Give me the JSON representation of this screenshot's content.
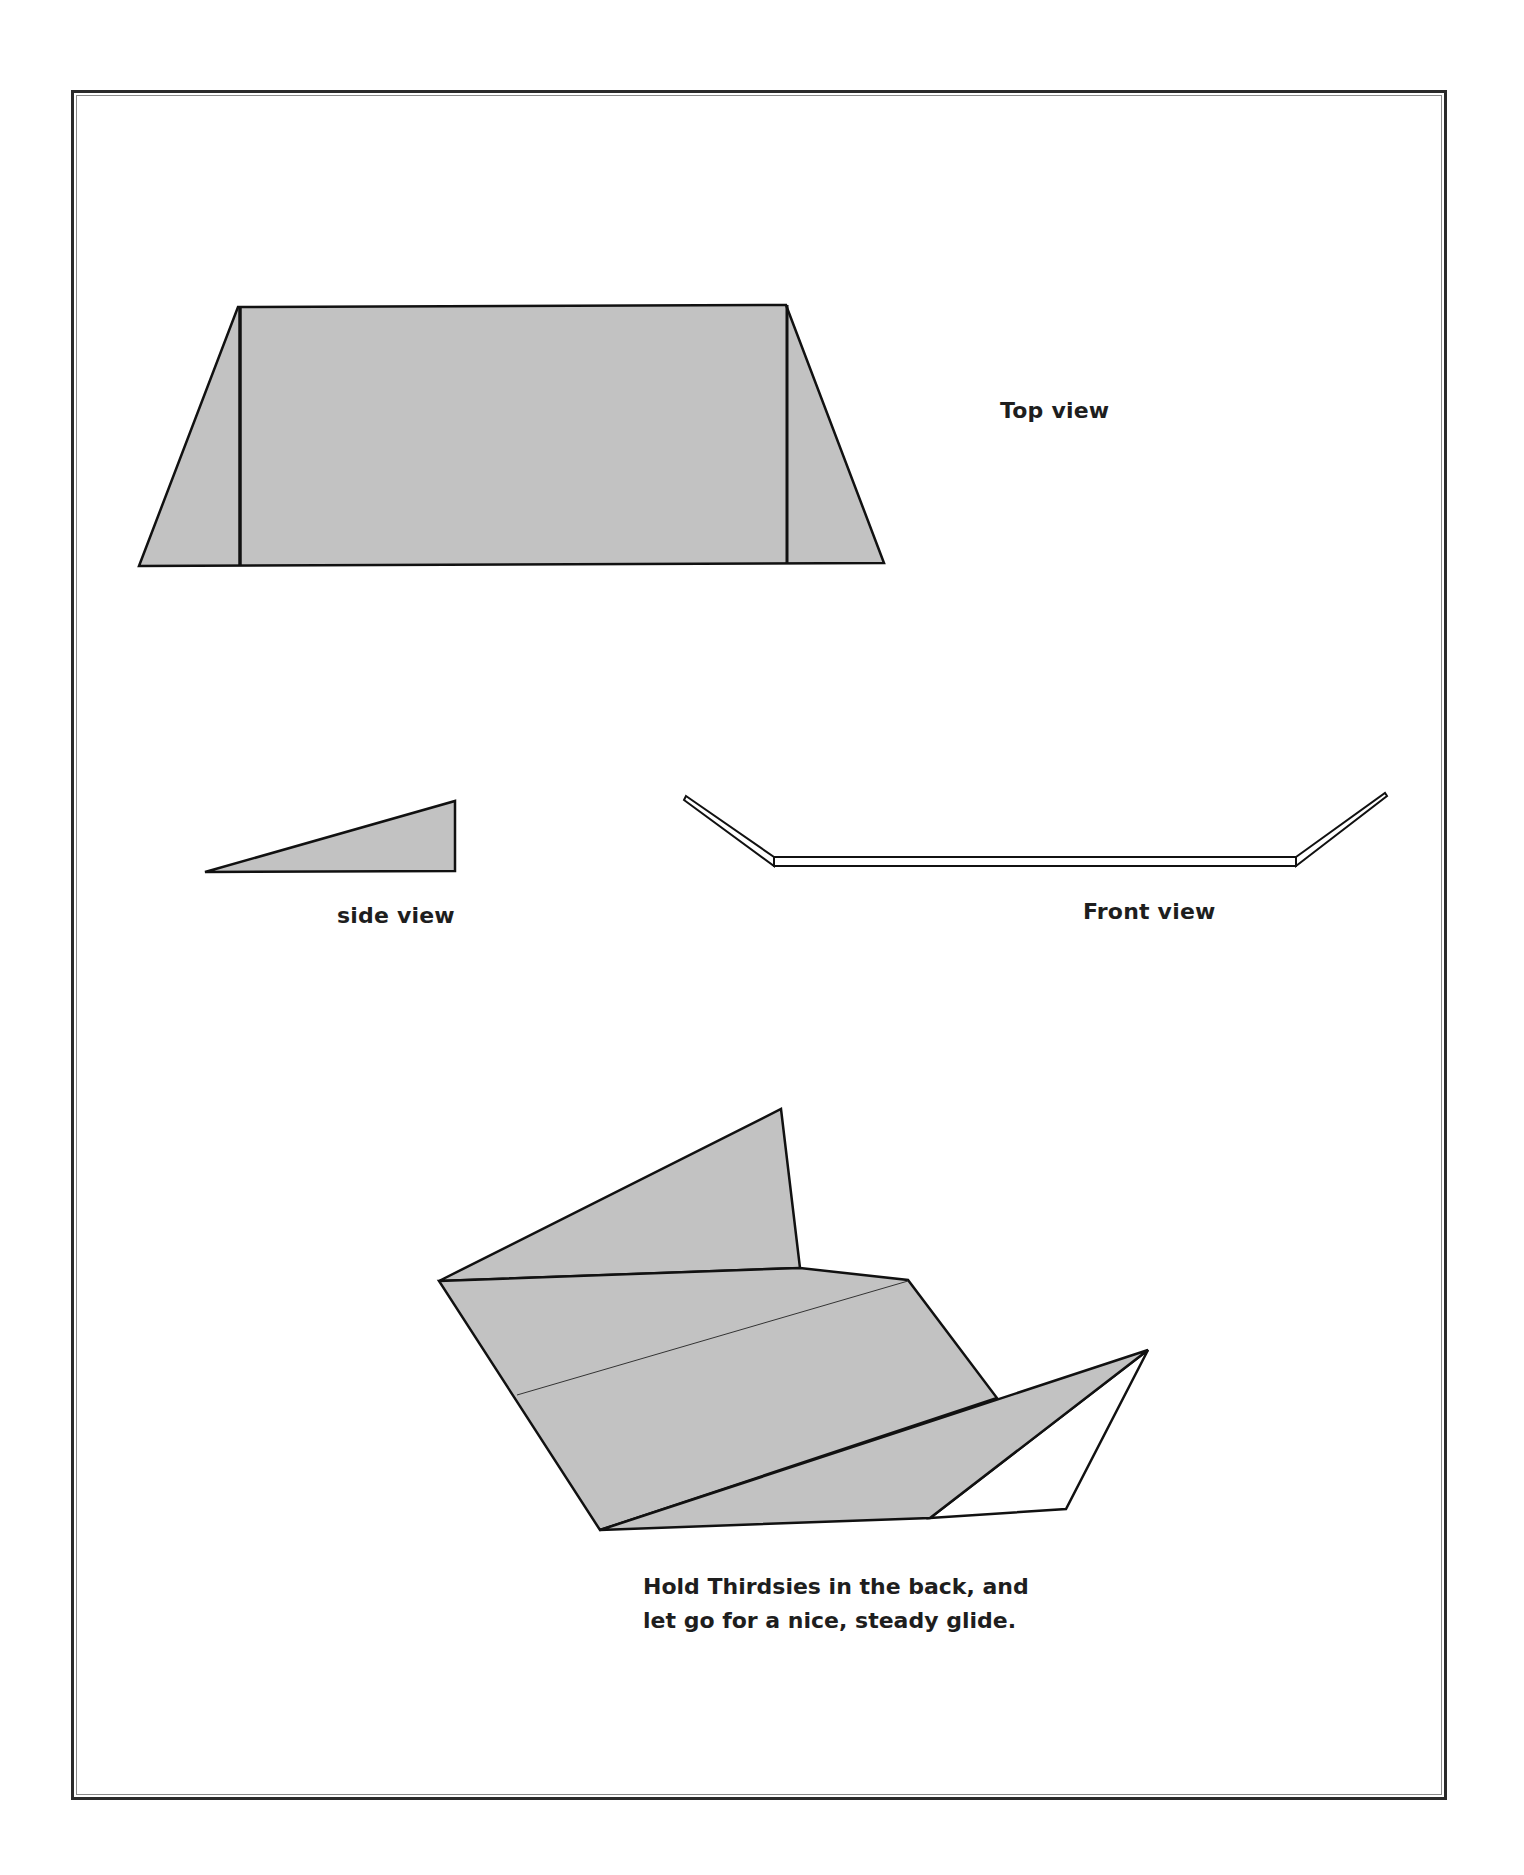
{
  "page": {
    "background": "#ffffff",
    "fill_gray": "#c2c2c2",
    "line_color": "#111111"
  },
  "diagrams": {
    "top_view": {
      "label": "Top view",
      "outline": [
        [
          139,
          566
        ],
        [
          238,
          307
        ],
        [
          786,
          305
        ],
        [
          884,
          563
        ]
      ],
      "fold_lines": [
        [
          [
            240,
            307
          ],
          [
            240,
            566
          ]
        ],
        [
          [
            787,
            305
          ],
          [
            787,
            564
          ]
        ]
      ]
    },
    "side_view": {
      "label": "side view",
      "triangle": [
        [
          205,
          872
        ],
        [
          455,
          801
        ],
        [
          455,
          871
        ]
      ]
    },
    "front_view": {
      "label": "Front view",
      "left_wing": [
        [
          686,
          797
        ],
        [
          772,
          860
        ]
      ],
      "right_wing": [
        [
          1298,
          858
        ],
        [
          1385,
          794
        ]
      ],
      "body_bar": {
        "x1": 772,
        "x2": 1298,
        "y_top": 857,
        "y_bottom": 866
      }
    },
    "glide_view": {
      "caption_lines": [
        "Hold Thirdsies in the back, and",
        "let go for a nice, steady glide."
      ],
      "top_wing": [
        [
          439,
          1281
        ],
        [
          781,
          1109
        ],
        [
          800,
          1268
        ]
      ],
      "body": [
        [
          439,
          1281
        ],
        [
          800,
          1268
        ],
        [
          908,
          1280
        ],
        [
          997,
          1398
        ],
        [
          600,
          1530
        ]
      ],
      "fold_line": [
        [
          517,
          1395
        ],
        [
          908,
          1281
        ]
      ],
      "lower_wing": [
        [
          600,
          1530
        ],
        [
          1148,
          1350
        ],
        [
          930,
          1518
        ]
      ],
      "white_tip": [
        [
          1148,
          1350
        ],
        [
          1066,
          1509
        ],
        [
          930,
          1518
        ]
      ]
    }
  }
}
